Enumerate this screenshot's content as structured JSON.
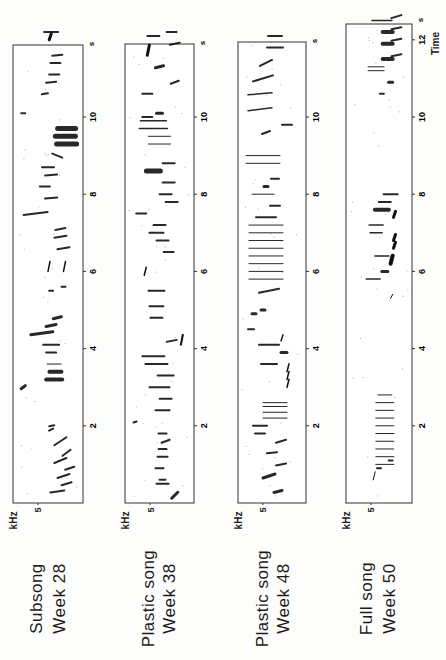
{
  "figure": {
    "orientation": "rotated-90-ccw",
    "axis_time_label": "Time",
    "axis_time_unit": "s",
    "axis_freq_label": "kHz",
    "freq_tick": "5",
    "time_ticks": [
      "2",
      "4",
      "6",
      "8",
      "10"
    ],
    "time_ticks_full": [
      "2",
      "4",
      "6",
      "8",
      "10",
      "12"
    ]
  },
  "panels": [
    {
      "title": "Subsong",
      "week": "Week  28"
    },
    {
      "title": "Plastic  song",
      "week": "Week  38"
    },
    {
      "title": "Plastic  song",
      "week": "Week  48"
    },
    {
      "title": "Full  song",
      "week": "Week  50"
    }
  ],
  "chart_data": {
    "type": "heatmap",
    "xlabel": "Time (s)",
    "ylabel": "Frequency (kHz)",
    "xlim": [
      0,
      12.5
    ],
    "freq_tick_labels": [
      "5"
    ],
    "series": [
      {
        "name": "Subsong Week 28",
        "time_range_s": [
          0,
          12.3
        ],
        "description": "sparse, variable, noisy syllables; dense note clusters near 3.2 s and 9.4 s"
      },
      {
        "name": "Plastic song Week 38",
        "time_range_s": [
          0,
          12.3
        ],
        "description": "more structured but variable syllables with harmonic stacks ~9.7 s"
      },
      {
        "name": "Plastic song Week 48",
        "time_range_s": [
          0,
          12.2
        ],
        "description": "repeated trill 5.5-7.3 s; buzz 2.0-2.7 s; rehearsed phrases"
      },
      {
        "name": "Full song Week 50",
        "time_range_s": [
          0.4,
          12.7
        ],
        "description": "stereotyped trill ~0.6-2.9 s, phrase 5.5-8.0 s, repeated motif 10.5-12.6 s"
      }
    ]
  }
}
